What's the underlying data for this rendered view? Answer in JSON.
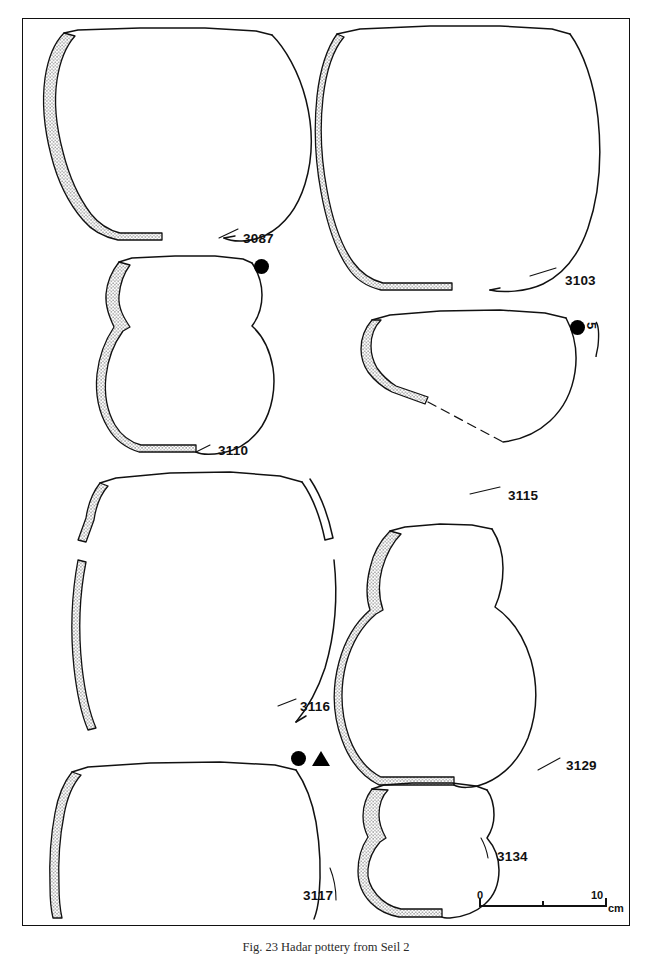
{
  "figure": {
    "type": "archaeological-pottery-plate",
    "caption": "Fig. 23 Hadar pottery from Seil 2",
    "caption_visibility": "clipped at bottom edge of image",
    "border": "thin black rectangular frame",
    "background_color": "#ffffff",
    "ink_color": "#111111"
  },
  "scale_bar": {
    "start_label": "0",
    "end_label": "10",
    "unit": "cm",
    "ticks": [
      "0",
      "",
      "10"
    ]
  },
  "vessels": [
    {
      "id": "3087",
      "label": "3087",
      "description": "large wide-mouthed jar, everted rim, rounded body, half profile section",
      "label_x": 243,
      "label_y": 231,
      "symbols": []
    },
    {
      "id": "3103",
      "label": "3103",
      "description": "large deep jar with tall rounded body and short everted rim",
      "label_x": 565,
      "label_y": 273,
      "symbols": []
    },
    {
      "id": "3110",
      "label": "3110",
      "description": "globular jar with short neck and everted rim",
      "label_x": 218,
      "label_y": 443,
      "symbols": [
        "filled-circle"
      ]
    },
    {
      "id": "3115",
      "label": "3115",
      "description": "shallow open bowl with reconstructed base shown as dashed line",
      "label_x": 508,
      "label_y": 488,
      "symbols": [
        "filled-circle",
        "rotated-mark"
      ]
    },
    {
      "id": "3116",
      "label": "3116",
      "description": "very large jar, only wall fragments drawn, wide mouth",
      "label_x": 300,
      "label_y": 699,
      "symbols": []
    },
    {
      "id": "3129",
      "label": "3129",
      "description": "large shouldered jar with flaring neck and everted rim",
      "label_x": 566,
      "label_y": 758,
      "symbols": []
    },
    {
      "id": "3117",
      "label": "3117",
      "description": "large straight-sided open vessel, half profile section",
      "label_x": 303,
      "label_y": 888,
      "symbols": [
        "filled-circle",
        "filled-triangle"
      ]
    },
    {
      "id": "3134",
      "label": "3134",
      "description": "small squat jar with short neck and rounded base",
      "label_x": 497,
      "label_y": 849,
      "symbols": []
    }
  ],
  "symbol_markers": [
    {
      "name": "filled-circle",
      "glyph": "●",
      "x": 254,
      "y": 259,
      "for": "3110"
    },
    {
      "name": "filled-circle",
      "glyph": "●",
      "x": 570,
      "y": 320,
      "for": "3115"
    },
    {
      "name": "rotated-mark",
      "glyph": "5",
      "x": 592,
      "y": 323,
      "for": "3115"
    },
    {
      "name": "filled-circle",
      "glyph": "●",
      "x": 291,
      "y": 751,
      "for": "3117"
    },
    {
      "name": "filled-triangle",
      "glyph": "▲",
      "x": 312,
      "y": 751,
      "for": "3117"
    }
  ]
}
